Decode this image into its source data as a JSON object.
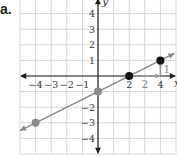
{
  "part_label": "a.",
  "chart_data": {
    "type": "line",
    "title": "",
    "xlabel": "x",
    "ylabel": "y",
    "xlim": [
      -5,
      5
    ],
    "ylim": [
      -5,
      5
    ],
    "grid": true,
    "x_ticks": [
      "-4",
      "-3",
      "-2",
      "-1",
      "2",
      "4"
    ],
    "y_ticks": [
      "4",
      "3",
      "2",
      "1",
      "-2",
      "-3",
      "-4"
    ],
    "line": {
      "slope": 0.5,
      "intercept": -1,
      "equation": "y = 1/2 x - 1",
      "color": "#8a8a8a"
    },
    "points": [
      {
        "x": -4,
        "y": -3,
        "color": "#8a8a8a"
      },
      {
        "x": 0,
        "y": -1,
        "color": "#8a8a8a"
      },
      {
        "x": 2,
        "y": 0,
        "color": "#111111"
      },
      {
        "x": 4,
        "y": 1,
        "color": "#111111"
      }
    ],
    "annotations": [
      {
        "type": "run-arrow",
        "from": [
          2,
          0
        ],
        "to": [
          4,
          0
        ],
        "label": "2"
      },
      {
        "type": "rise-arrow",
        "from": [
          4,
          0
        ],
        "to": [
          4,
          1
        ],
        "label": "1"
      }
    ]
  }
}
